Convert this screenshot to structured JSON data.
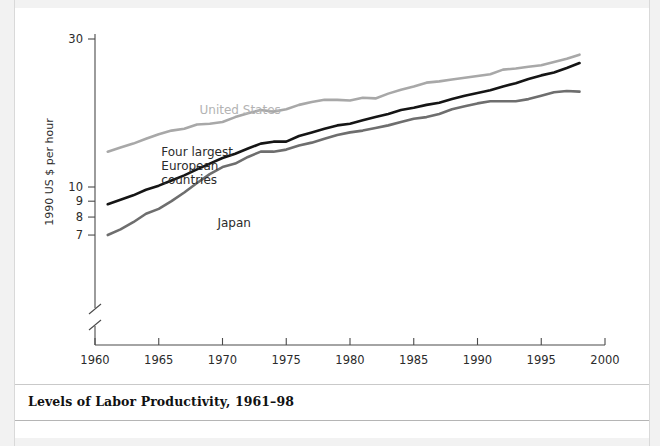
{
  "figure": {
    "caption": "Levels of Labor Productivity, 1961–98"
  },
  "chart_data": {
    "type": "line",
    "title": "Levels of Labor Productivity, 1961–98",
    "xlabel": "",
    "ylabel": "1990 US $ per hour",
    "yscale": "log",
    "ylim": [
      6.6,
      30
    ],
    "xlim": [
      1960,
      2000
    ],
    "grid": false,
    "axis_break": "y-axis broken below 7",
    "legend": "inline labels on curves",
    "x_ticks": [
      1960,
      1965,
      1970,
      1975,
      1980,
      1985,
      1990,
      1995,
      2000
    ],
    "x_tick_labels": [
      "1960",
      "1965",
      "1970",
      "1975",
      "1980",
      "1985",
      "1990",
      "1995",
      "2000"
    ],
    "y_ticks": [
      7,
      8,
      9,
      10,
      30
    ],
    "y_tick_labels": [
      "7",
      "8",
      "9",
      "10",
      "30"
    ],
    "x": [
      1961,
      1962,
      1963,
      1964,
      1965,
      1966,
      1967,
      1968,
      1969,
      1970,
      1971,
      1972,
      1973,
      1974,
      1975,
      1976,
      1977,
      1978,
      1979,
      1980,
      1981,
      1982,
      1983,
      1984,
      1985,
      1986,
      1987,
      1988,
      1989,
      1990,
      1991,
      1992,
      1993,
      1994,
      1995,
      1996,
      1997,
      1998
    ],
    "series": [
      {
        "name": "United States",
        "color": "#a8a8a8",
        "label_x": 1968.2,
        "label_y": 17.2,
        "values": [
          13.0,
          13.4,
          13.8,
          14.3,
          14.8,
          15.2,
          15.4,
          15.9,
          16.0,
          16.2,
          16.8,
          17.3,
          17.7,
          17.5,
          17.8,
          18.4,
          18.8,
          19.1,
          19.1,
          19.0,
          19.4,
          19.3,
          20.0,
          20.6,
          21.1,
          21.7,
          21.9,
          22.2,
          22.5,
          22.8,
          23.1,
          23.9,
          24.1,
          24.4,
          24.7,
          25.3,
          25.9,
          26.7
        ]
      },
      {
        "name": "Four largest European countries",
        "color": "#151515",
        "label_x": 1965.2,
        "label_y": 12.6,
        "values": [
          8.8,
          9.1,
          9.4,
          9.8,
          10.1,
          10.5,
          10.9,
          11.4,
          11.9,
          12.4,
          12.8,
          13.3,
          13.8,
          14.0,
          14.0,
          14.6,
          15.0,
          15.4,
          15.8,
          16.0,
          16.4,
          16.8,
          17.2,
          17.7,
          18.0,
          18.4,
          18.7,
          19.2,
          19.7,
          20.1,
          20.5,
          21.1,
          21.6,
          22.3,
          22.9,
          23.4,
          24.2,
          25.1
        ]
      },
      {
        "name": "Japan",
        "color": "#6e6e6e",
        "label_x": 1969.6,
        "label_y": 7.45,
        "values": [
          7.0,
          7.3,
          7.7,
          8.2,
          8.5,
          9.0,
          9.6,
          10.3,
          11.0,
          11.6,
          11.9,
          12.5,
          13.0,
          13.0,
          13.2,
          13.6,
          13.9,
          14.3,
          14.7,
          15.0,
          15.2,
          15.5,
          15.8,
          16.2,
          16.6,
          16.8,
          17.2,
          17.8,
          18.2,
          18.6,
          18.9,
          18.9,
          18.9,
          19.2,
          19.7,
          20.2,
          20.4,
          20.3
        ]
      }
    ]
  }
}
